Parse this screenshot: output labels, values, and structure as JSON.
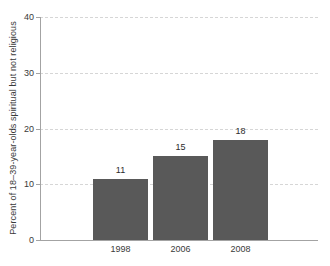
{
  "chart_data": {
    "type": "bar",
    "categories": [
      "1998",
      "2006",
      "2008"
    ],
    "values": [
      11,
      15,
      18
    ],
    "data_labels": [
      "11",
      "15",
      "18"
    ],
    "title": "",
    "xlabel": "",
    "ylabel": "Percent of 18–39-year-olds spiritual but not religious",
    "ylim": [
      0,
      40
    ],
    "yticks": [
      0,
      10,
      20,
      30,
      40
    ],
    "grid": "horizontal-dashed",
    "legend": "none",
    "colors": {
      "bar": "#595959",
      "axis": "#a3a3a3",
      "gridline": "#d6d6d6",
      "text": "#3a3a3a"
    }
  }
}
